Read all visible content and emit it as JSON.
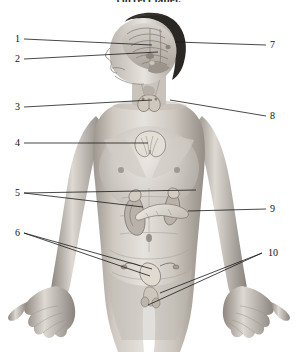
{
  "page": {
    "instruction_text": "correct label.",
    "background_color": "#ffffff",
    "line_color": "#1a1a1a",
    "label_text_color": "#111111",
    "artwork_type": "grayscale anatomical illustration",
    "artwork_subject": "human male torso showing endocrine glands",
    "artwork_tone_light": "#e9e7e4",
    "artwork_tone_mid": "#b9b4ae",
    "artwork_tone_dark": "#6e6862",
    "artwork_hair_color": "#2a2724"
  },
  "diagram": {
    "left_labels": [
      {
        "number": "1",
        "x": 14,
        "y": 39,
        "target_x": 152,
        "target_y": 45,
        "organ_region": "hypothalamus"
      },
      {
        "number": "2",
        "x": 14,
        "y": 59,
        "target_x": 158,
        "target_y": 52,
        "organ_region": "pituitary-gland"
      },
      {
        "number": "3",
        "x": 14,
        "y": 107,
        "target_x": 152,
        "target_y": 100,
        "organ_region": "parathyroid-gland"
      },
      {
        "number": "4",
        "x": 14,
        "y": 143,
        "target_x": 148,
        "target_y": 143,
        "organ_region": "thymus"
      },
      {
        "number": "5",
        "x": 14,
        "y": 193,
        "target_x": 143,
        "target_y": 206,
        "organ_region": "adrenal-gland-kidney"
      },
      {
        "number": "6",
        "x": 14,
        "y": 233,
        "target_x": 152,
        "target_y": 268,
        "organ_region": "uterus-ovary"
      }
    ],
    "right_labels": [
      {
        "number": "7",
        "x": 276,
        "y": 45,
        "target_x": 176,
        "target_y": 42,
        "organ_region": "pineal-gland"
      },
      {
        "number": "8",
        "x": 276,
        "y": 116,
        "target_x": 170,
        "target_y": 100,
        "organ_region": "thyroid-gland"
      },
      {
        "number": "9",
        "x": 276,
        "y": 209,
        "target_x": 188,
        "target_y": 209,
        "organ_region": "pancreas"
      },
      {
        "number": "10",
        "x": 272,
        "y": 253,
        "target_x": 160,
        "target_y": 292,
        "organ_region": "testis-ovary"
      }
    ],
    "total_label_count": "10"
  }
}
